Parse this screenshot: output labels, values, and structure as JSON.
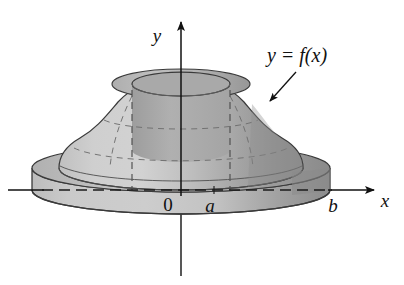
{
  "figure": {
    "type": "math-diagram",
    "background_color": "#ffffff",
    "width": 404,
    "height": 285
  },
  "axes": {
    "x_axis": {
      "label": "x",
      "label_x": 385,
      "label_y": 207,
      "line_y": 190,
      "line_x_start": 8,
      "line_x_end": 374,
      "arrow": "right",
      "hidden_segment_style": "dashed",
      "hidden_from_x": 44,
      "hidden_to_x": 330
    },
    "y_axis": {
      "label": "y",
      "label_x": 157,
      "label_y": 42,
      "line_x": 181,
      "line_y_top": 20,
      "line_y_bottom": 276,
      "arrow": "up"
    },
    "origin": {
      "label": "0",
      "label_x": 168,
      "label_y": 211
    },
    "ticks": [
      {
        "name": "a",
        "label": "a",
        "x": 214,
        "label_x": 210,
        "label_y": 212
      },
      {
        "name": "b",
        "label": "b",
        "x": 330,
        "label_x": 333,
        "label_y": 212
      }
    ]
  },
  "curve_label": {
    "text": "y = f(x)",
    "text_x": 297,
    "text_y": 62,
    "leader_from_x": 296,
    "leader_from_y": 72,
    "leader_to_x": 270,
    "leader_to_y": 101
  },
  "solid": {
    "name": "dome-with-cylindrical-hole",
    "description": "Bell-shaped solid of revolution seated on a short cylindrical slab, with a cylindrical bore through the axis",
    "colors": {
      "dome_light": "#cdcdcd",
      "dome_mid": "#b4b4b4",
      "dome_dark": "#909090",
      "slab_front": "#c4c4c4",
      "slab_right_dark": "#8e8e8e",
      "top_ring": "#b8b8b8",
      "hole_interior": "#a8a8a8",
      "outline": "#3a3a3a",
      "gridline": "#6b6b6b",
      "dashed_hidden": "#5a5a5a"
    },
    "geometry": {
      "center_x": 181,
      "base_top_y": 168,
      "base_bottom_y": 196,
      "base_radius_x": 149,
      "base_radius_y": 24,
      "dome_apex_y": 80,
      "dome_radius_x": 122,
      "hole_radius_x": 49,
      "hole_radius_y": 12,
      "hole_top_y": 84
    },
    "grid": {
      "meridians": 4,
      "latitudes": 3
    }
  }
}
